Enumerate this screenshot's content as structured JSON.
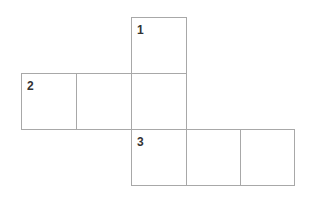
{
  "diagram": {
    "type": "cube-net",
    "line_color": "#a8a8a8",
    "label_color": "#333333",
    "cell_size": 55,
    "cells": [
      {
        "id": "top",
        "x": 131,
        "y": 17,
        "label": "1"
      },
      {
        "id": "mid-left",
        "x": 21,
        "y": 73,
        "label": "2"
      },
      {
        "id": "mid-center",
        "x": 76,
        "y": 73,
        "label": ""
      },
      {
        "id": "mid-right",
        "x": 131,
        "y": 73,
        "label": ""
      },
      {
        "id": "bottom-left",
        "x": 131,
        "y": 129,
        "label": "3"
      },
      {
        "id": "bottom-center",
        "x": 186,
        "y": 129,
        "label": ""
      },
      {
        "id": "bottom-right",
        "x": 240,
        "y": 129,
        "label": ""
      }
    ]
  }
}
